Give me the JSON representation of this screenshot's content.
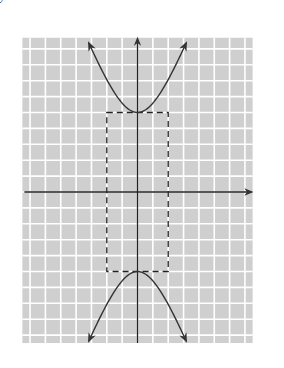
{
  "chart_data": {
    "type": "line",
    "title": "",
    "xlabel": "x",
    "ylabel": "y",
    "xlim": [
      -8,
      8
    ],
    "ylim": [
      -10,
      10
    ],
    "grid": true,
    "grid_color": "#ffffff",
    "background_color": "#cfcfcf",
    "x_ticks": [
      -7,
      -6,
      -5,
      -4,
      -3,
      -2,
      -1,
      1,
      2,
      3,
      4,
      5,
      6,
      7
    ],
    "x_tick_labels": [
      "−7",
      "−6",
      "−5",
      "−4",
      "−3",
      "−2",
      "−1",
      "1",
      "2",
      "3",
      "4",
      "5",
      "6",
      "7"
    ],
    "y_ticks": [
      9,
      8,
      7,
      6,
      5,
      4,
      3,
      2,
      1,
      -1,
      -2,
      -3,
      -4,
      -5,
      -6,
      -7,
      -8,
      -9
    ],
    "y_tick_labels": [
      "9",
      "8",
      "7",
      "6",
      "5",
      "4",
      "3",
      "2",
      "1",
      "−1",
      "−2",
      "−3",
      "−4",
      "−5",
      "−6",
      "−7",
      "−8",
      "−9"
    ],
    "origin_label": "0",
    "series": [
      {
        "name": "hyperbola-upper-branch",
        "equation": "y = 5*sqrt(1 + x^2/4)",
        "x_range": [
          -3.17,
          3.17
        ],
        "style": "solid",
        "arrows": "both"
      },
      {
        "name": "hyperbola-lower-branch",
        "equation": "y = -5*sqrt(1 + x^2/4)",
        "x_range": [
          -3.17,
          3.17
        ],
        "style": "solid",
        "arrows": "both"
      },
      {
        "name": "asymptote-positive",
        "equation": "y = 2.5x",
        "x_range": [
          -4,
          4
        ],
        "style": "dashed"
      },
      {
        "name": "asymptote-negative",
        "equation": "y = -2.5x",
        "x_range": [
          -4,
          4
        ],
        "style": "dashed"
      }
    ],
    "fundamental_rectangle": {
      "x": [
        -2,
        2
      ],
      "y": [
        -5,
        5
      ],
      "style": "dashed"
    },
    "points": [
      {
        "label": "vertex-top",
        "x": 0,
        "y": 5
      },
      {
        "label": "vertex-bottom",
        "x": 0,
        "y": -5
      }
    ]
  }
}
